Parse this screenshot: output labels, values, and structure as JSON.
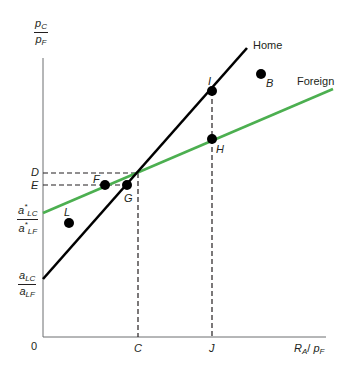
{
  "diagram": {
    "y_axis_label": {
      "numerator": "p",
      "numerator_sub": "C",
      "denominator": "p",
      "denominator_sub": "F"
    },
    "x_axis_label": {
      "main": "R",
      "main_sub": "A",
      "sep": "/ ",
      "p": "p",
      "p_sub": "F"
    },
    "origin_label": "0",
    "lines": {
      "home": {
        "label": "Home",
        "color": "#000000"
      },
      "foreign": {
        "label": "Foreign",
        "color": "#4caf50"
      }
    },
    "y_ticks": {
      "D": "D",
      "E": "E",
      "foreign_intercept": {
        "num": "a",
        "num_sub": "LC",
        "num_sup": "*",
        "den": "a",
        "den_sub": "LF",
        "den_sup": "*"
      },
      "home_intercept": {
        "num": "a",
        "num_sub": "LC",
        "den": "a",
        "den_sub": "LF"
      }
    },
    "x_ticks": {
      "C": "C",
      "J": "J"
    },
    "points": {
      "I": "I",
      "B": "B",
      "H": "H",
      "F": "F",
      "G": "G",
      "L": "L"
    }
  }
}
